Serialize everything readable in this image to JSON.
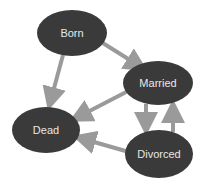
{
  "diagram": {
    "type": "state-diagram",
    "colors": {
      "node_fill": "#3a3a3a",
      "node_text": "#e8e8e8",
      "arrow": "#9a9a9a",
      "background": "#ffffff"
    },
    "nodes": [
      {
        "id": "born",
        "label": "Born",
        "cx": 72,
        "cy": 33,
        "rx": 35,
        "ry": 23
      },
      {
        "id": "married",
        "label": "Married",
        "cx": 158,
        "cy": 83,
        "rx": 35,
        "ry": 22
      },
      {
        "id": "dead",
        "label": "Dead",
        "cx": 46,
        "cy": 130,
        "rx": 34,
        "ry": 23
      },
      {
        "id": "divorced",
        "label": "Divorced",
        "cx": 159,
        "cy": 154,
        "rx": 34,
        "ry": 24
      }
    ],
    "edges": [
      {
        "from": "born",
        "to": "married"
      },
      {
        "from": "born",
        "to": "dead"
      },
      {
        "from": "married",
        "to": "dead"
      },
      {
        "from": "married",
        "to": "divorced"
      },
      {
        "from": "divorced",
        "to": "married"
      },
      {
        "from": "divorced",
        "to": "dead"
      }
    ]
  }
}
